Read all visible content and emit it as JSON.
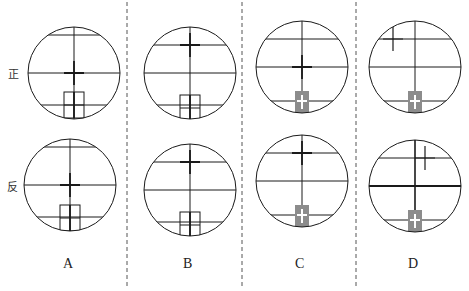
{
  "row_labels": {
    "front": "正",
    "reverse": "反"
  },
  "options": [
    {
      "label": "A",
      "x": 68
    },
    {
      "label": "B",
      "x": 188
    },
    {
      "label": "C",
      "x": 300
    },
    {
      "label": "D",
      "x": 414
    }
  ],
  "colors": {
    "line": "#1a1a1a",
    "prism_fill": "#8c8c8c",
    "divider": "#555555"
  },
  "panels": [
    {
      "id": "A-front",
      "cx": 74,
      "cy": 73,
      "r": 46,
      "hlines": [
        -38,
        0,
        32
      ],
      "cross_dx": 0,
      "cross_dy": 0,
      "cross_bold": true,
      "box": "outline",
      "box_dy": 19
    },
    {
      "id": "A-reverse",
      "cx": 70,
      "cy": 185,
      "r": 46,
      "hlines": [
        -38,
        0,
        32
      ],
      "cross_dx": 0,
      "cross_dy": 0,
      "cross_bold": true,
      "box": "outline",
      "box_dy": 20
    },
    {
      "id": "B-front",
      "cx": 190,
      "cy": 73,
      "r": 46,
      "hlines": [
        -28,
        0,
        32
      ],
      "cross_dx": 0,
      "cross_dy": -28,
      "cross_bold": true,
      "box": "outline",
      "box_dy": 22
    },
    {
      "id": "B-reverse",
      "cx": 190,
      "cy": 190,
      "r": 46,
      "hlines": [
        -28,
        0,
        32
      ],
      "cross_dx": 0,
      "cross_dy": -28,
      "cross_bold": true,
      "box": "outline",
      "box_dy": 22
    },
    {
      "id": "C-front",
      "cx": 302,
      "cy": 67,
      "r": 46,
      "hlines": [
        -28,
        0,
        34
      ],
      "cross_dx": 0,
      "cross_dy": 0,
      "cross_bold": true,
      "box": "prism",
      "box_dy": 24
    },
    {
      "id": "C-reverse",
      "cx": 302,
      "cy": 181,
      "r": 46,
      "hlines": [
        -28,
        0,
        34
      ],
      "cross_dx": 0,
      "cross_dy": -28,
      "cross_bold": true,
      "box": "prism",
      "box_dy": 24
    },
    {
      "id": "D-front",
      "cx": 415,
      "cy": 67,
      "r": 46,
      "hlines": [
        -28,
        0,
        34
      ],
      "cross_dx": -22,
      "cross_dy": -28,
      "cross_bold": false,
      "box": "prism",
      "box_dy": 24
    },
    {
      "id": "D-reverse",
      "cx": 415,
      "cy": 186,
      "r": 46,
      "hlines": [
        -28,
        0,
        34
      ],
      "cross_dx": 10,
      "cross_dy": -28,
      "cross_bold": false,
      "box": "prism",
      "box_dy": 24,
      "bold_mid": true
    }
  ],
  "dividers": [
    127,
    242,
    356
  ]
}
